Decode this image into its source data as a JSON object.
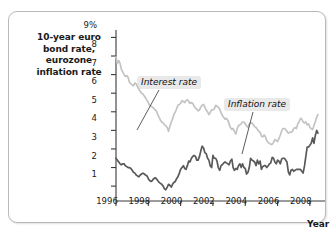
{
  "chart_data": {
    "type": "line",
    "title": "",
    "ylabel": "10-year euro bond rate, eurozone inflation rate",
    "xlabel": "Year",
    "xlim": [
      1996,
      2008.75
    ],
    "ylim": [
      0.2,
      9.4
    ],
    "grid": false,
    "legend_position": "inline-annotations",
    "y_tick_labels": [
      "9%",
      "8",
      "7",
      "6",
      "5",
      "4",
      "3",
      "2",
      "1"
    ],
    "y_tick_values": [
      9,
      8,
      7,
      6,
      5,
      4,
      3,
      2,
      1
    ],
    "x_tick_labels": [
      "1996",
      "1998",
      "2000",
      "2002",
      "2004",
      "2006",
      "2008"
    ],
    "x_tick_values": [
      1996,
      1998,
      2000,
      2002,
      2004,
      2006,
      2008
    ],
    "annotations": [
      {
        "text": "Interest rate",
        "points_to_series": "Interest rate"
      },
      {
        "text": "Inflation rate",
        "points_to_series": "Inflation rate"
      }
    ],
    "series": [
      {
        "name": "Interest rate",
        "color": "#c3c3c3",
        "x": [
          1996.0,
          1996.08,
          1996.17,
          1996.25,
          1996.33,
          1996.42,
          1996.5,
          1996.58,
          1996.67,
          1996.75,
          1996.83,
          1996.92,
          1997.0,
          1997.08,
          1997.17,
          1997.25,
          1997.33,
          1997.42,
          1997.5,
          1997.58,
          1997.67,
          1997.75,
          1997.83,
          1997.92,
          1998.0,
          1998.08,
          1998.17,
          1998.25,
          1998.33,
          1998.42,
          1998.5,
          1998.58,
          1998.67,
          1998.75,
          1998.83,
          1998.92,
          1999.0,
          1999.08,
          1999.17,
          1999.25,
          1999.33,
          1999.42,
          1999.5,
          1999.58,
          1999.67,
          1999.75,
          1999.83,
          1999.92,
          2000.0,
          2000.08,
          2000.17,
          2000.25,
          2000.33,
          2000.42,
          2000.5,
          2000.58,
          2000.67,
          2000.75,
          2000.83,
          2000.92,
          2001.0,
          2001.08,
          2001.17,
          2001.25,
          2001.33,
          2001.42,
          2001.5,
          2001.58,
          2001.67,
          2001.75,
          2001.83,
          2001.92,
          2002.0,
          2002.08,
          2002.17,
          2002.25,
          2002.33,
          2002.42,
          2002.5,
          2002.58,
          2002.67,
          2002.75,
          2002.83,
          2002.92,
          2003.0,
          2003.08,
          2003.17,
          2003.25,
          2003.33,
          2003.42,
          2003.5,
          2003.58,
          2003.67,
          2003.75,
          2003.83,
          2003.92,
          2004.0,
          2004.08,
          2004.17,
          2004.25,
          2004.33,
          2004.42,
          2004.5,
          2004.58,
          2004.67,
          2004.75,
          2004.83,
          2004.92,
          2005.0,
          2005.08,
          2005.17,
          2005.25,
          2005.33,
          2005.42,
          2005.5,
          2005.58,
          2005.67,
          2005.75,
          2005.83,
          2005.92,
          2006.0,
          2006.08,
          2006.17,
          2006.25,
          2006.33,
          2006.42,
          2006.5,
          2006.58,
          2006.67,
          2006.75,
          2006.83,
          2006.92,
          2007.0,
          2007.08,
          2007.17,
          2007.25,
          2007.33,
          2007.42,
          2007.5,
          2007.58,
          2007.67,
          2007.75,
          2007.83,
          2007.92,
          2008.0,
          2008.08,
          2008.17,
          2008.25,
          2008.33,
          2008.42,
          2008.5
        ],
        "values": [
          7.95,
          7.6,
          7.75,
          7.6,
          7.3,
          7.15,
          7.0,
          6.9,
          6.95,
          6.85,
          6.6,
          6.5,
          6.45,
          6.4,
          6.55,
          6.5,
          6.35,
          6.2,
          6.1,
          6.0,
          5.95,
          5.85,
          5.75,
          5.6,
          5.5,
          5.35,
          5.3,
          5.25,
          5.2,
          5.1,
          5.05,
          4.85,
          4.7,
          4.55,
          4.45,
          4.4,
          4.3,
          4.25,
          4.15,
          3.95,
          4.2,
          4.45,
          4.6,
          4.85,
          5.0,
          5.15,
          5.35,
          5.4,
          5.45,
          5.6,
          5.55,
          5.5,
          5.6,
          5.65,
          5.55,
          5.45,
          5.5,
          5.45,
          5.3,
          5.2,
          5.15,
          5.05,
          5.1,
          5.25,
          5.35,
          5.4,
          5.25,
          5.1,
          5.0,
          4.85,
          4.95,
          5.1,
          5.1,
          5.15,
          5.35,
          5.3,
          5.25,
          5.15,
          4.95,
          4.8,
          4.7,
          4.6,
          4.65,
          4.55,
          4.35,
          4.15,
          4.05,
          4.1,
          3.95,
          3.8,
          4.1,
          4.25,
          4.3,
          4.35,
          4.45,
          4.45,
          4.35,
          4.25,
          4.15,
          4.35,
          4.4,
          4.4,
          4.3,
          4.2,
          4.15,
          4.05,
          3.95,
          3.9,
          3.7,
          3.65,
          3.75,
          3.65,
          3.45,
          3.35,
          3.3,
          3.25,
          3.25,
          3.35,
          3.5,
          3.45,
          3.4,
          3.55,
          3.75,
          3.95,
          4.1,
          4.1,
          4.05,
          3.95,
          3.85,
          3.9,
          3.9,
          3.95,
          4.1,
          4.15,
          4.1,
          4.35,
          4.45,
          4.65,
          4.6,
          4.45,
          4.4,
          4.45,
          4.3,
          4.35,
          4.15,
          4.1,
          4.05,
          4.25,
          4.45,
          4.7,
          4.85
        ]
      },
      {
        "name": "Inflation rate",
        "color": "#595959",
        "x": [
          1996.0,
          1996.08,
          1996.17,
          1996.25,
          1996.33,
          1996.42,
          1996.5,
          1996.58,
          1996.67,
          1996.75,
          1996.83,
          1996.92,
          1997.0,
          1997.08,
          1997.17,
          1997.25,
          1997.33,
          1997.42,
          1997.5,
          1997.58,
          1997.67,
          1997.75,
          1997.83,
          1997.92,
          1998.0,
          1998.08,
          1998.17,
          1998.25,
          1998.33,
          1998.42,
          1998.5,
          1998.58,
          1998.67,
          1998.75,
          1998.83,
          1998.92,
          1999.0,
          1999.08,
          1999.17,
          1999.25,
          1999.33,
          1999.42,
          1999.5,
          1999.58,
          1999.67,
          1999.75,
          1999.83,
          1999.92,
          2000.0,
          2000.08,
          2000.17,
          2000.25,
          2000.33,
          2000.42,
          2000.5,
          2000.58,
          2000.67,
          2000.75,
          2000.83,
          2000.92,
          2001.0,
          2001.08,
          2001.17,
          2001.25,
          2001.33,
          2001.42,
          2001.5,
          2001.58,
          2001.67,
          2001.75,
          2001.83,
          2001.92,
          2002.0,
          2002.08,
          2002.17,
          2002.25,
          2002.33,
          2002.42,
          2002.5,
          2002.58,
          2002.67,
          2002.75,
          2002.83,
          2002.92,
          2003.0,
          2003.08,
          2003.17,
          2003.25,
          2003.33,
          2003.42,
          2003.5,
          2003.58,
          2003.67,
          2003.75,
          2003.83,
          2003.92,
          2004.0,
          2004.08,
          2004.17,
          2004.25,
          2004.33,
          2004.42,
          2004.5,
          2004.58,
          2004.67,
          2004.75,
          2004.83,
          2004.92,
          2005.0,
          2005.08,
          2005.17,
          2005.25,
          2005.33,
          2005.42,
          2005.5,
          2005.58,
          2005.67,
          2005.75,
          2005.83,
          2005.92,
          2006.0,
          2006.08,
          2006.17,
          2006.25,
          2006.33,
          2006.42,
          2006.5,
          2006.58,
          2006.67,
          2006.75,
          2006.83,
          2006.92,
          2007.0,
          2007.08,
          2007.17,
          2007.25,
          2007.33,
          2007.42,
          2007.5,
          2007.58,
          2007.67,
          2007.75,
          2007.83,
          2007.92,
          2008.0,
          2008.08,
          2008.17,
          2008.25,
          2008.33,
          2008.42,
          2008.5
        ],
        "values": [
          2.5,
          2.4,
          2.3,
          2.2,
          2.15,
          2.2,
          2.2,
          2.1,
          2.05,
          2.0,
          2.0,
          1.95,
          1.85,
          1.75,
          1.7,
          1.6,
          1.55,
          1.5,
          1.6,
          1.65,
          1.7,
          1.65,
          1.6,
          1.55,
          1.4,
          1.3,
          1.25,
          1.3,
          1.4,
          1.45,
          1.4,
          1.3,
          1.2,
          1.15,
          1.1,
          1.0,
          0.85,
          0.8,
          0.95,
          1.1,
          1.05,
          0.95,
          1.1,
          1.2,
          1.25,
          1.4,
          1.5,
          1.7,
          1.9,
          2.0,
          2.1,
          1.95,
          1.9,
          2.1,
          2.35,
          2.3,
          2.5,
          2.6,
          2.65,
          2.6,
          2.4,
          2.4,
          2.6,
          2.9,
          3.15,
          3.05,
          2.8,
          2.75,
          2.5,
          2.4,
          2.1,
          2.0,
          2.65,
          2.5,
          2.5,
          2.35,
          2.0,
          1.85,
          2.1,
          2.15,
          2.25,
          2.3,
          2.25,
          2.2,
          2.15,
          2.35,
          2.45,
          2.0,
          1.85,
          1.95,
          1.9,
          2.1,
          2.2,
          2.0,
          2.2,
          2.0,
          1.95,
          1.65,
          1.75,
          2.0,
          2.5,
          2.4,
          2.35,
          2.3,
          2.1,
          2.4,
          2.2,
          2.35,
          1.9,
          2.05,
          2.1,
          2.1,
          2.0,
          2.1,
          2.2,
          2.25,
          2.55,
          2.5,
          2.3,
          2.2,
          2.4,
          2.35,
          2.2,
          2.45,
          2.5,
          2.5,
          2.4,
          2.3,
          1.75,
          1.6,
          1.85,
          1.9,
          1.8,
          1.85,
          1.9,
          1.9,
          1.9,
          1.9,
          1.8,
          1.7,
          2.1,
          2.6,
          3.1,
          3.1,
          3.2,
          3.3,
          3.6,
          3.3,
          3.7,
          4.0,
          3.85
        ]
      }
    ]
  }
}
